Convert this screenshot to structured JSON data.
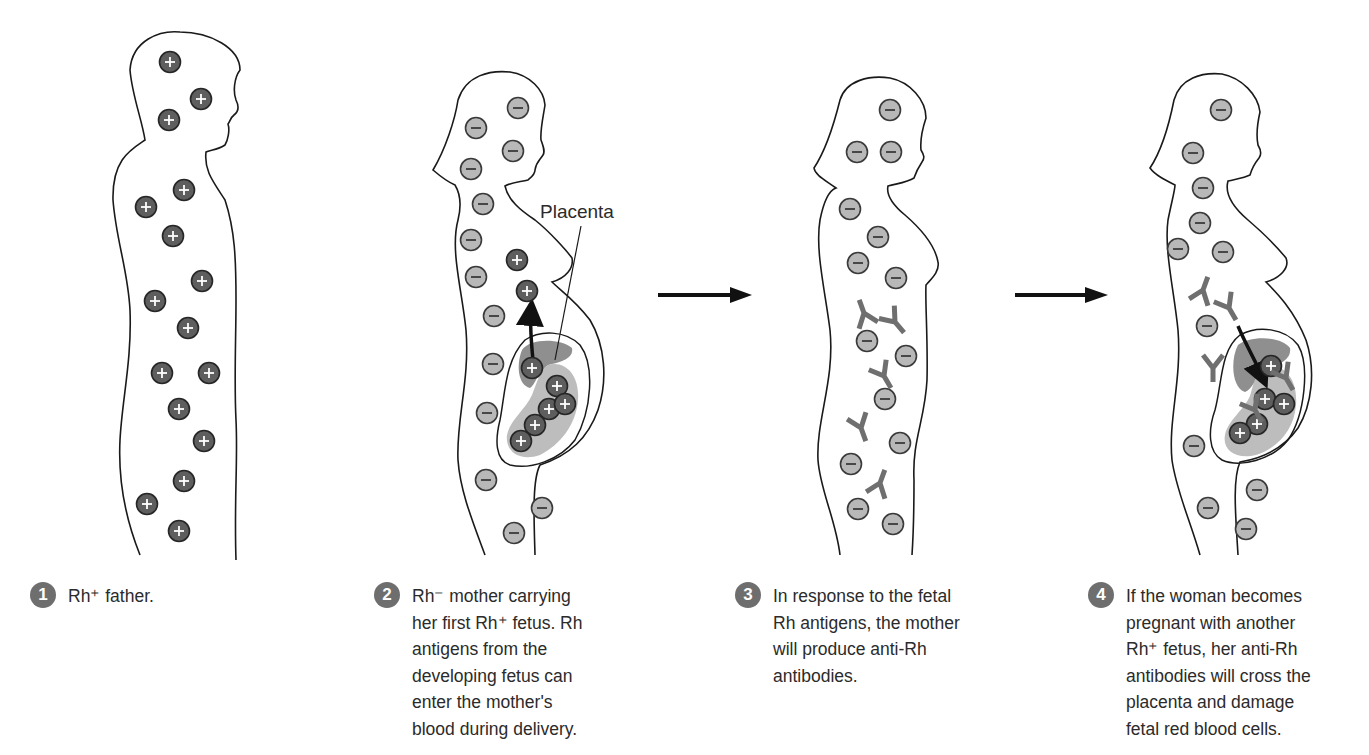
{
  "colors": {
    "rh_positive_cell": "#5e5e5e",
    "rh_negative_cell": "#b8b8b8",
    "antibody": "#7a7a7a",
    "placenta": "#8f8f8f",
    "fetus": "#bdbdbd",
    "outline": "#1a1a1a",
    "badge": "#6e6e6e"
  },
  "labels": {
    "placenta": "Placenta"
  },
  "legend": {
    "positive_symbol": "+",
    "negative_symbol": "−"
  },
  "steps": [
    {
      "number": "1",
      "text": "Rh⁺ father."
    },
    {
      "number": "2",
      "text": "Rh⁻ mother carrying\nher first Rh⁺ fetus.  Rh\nantigens from the\ndeveloping fetus can\nenter the mother's\nblood during delivery."
    },
    {
      "number": "3",
      "text": "In response to the fetal\nRh antigens, the mother\nwill produce anti-Rh\nantibodies."
    },
    {
      "number": "4",
      "text": "If the woman becomes\npregnant with another\nRh⁺ fetus, her anti-Rh\nantibodies will cross the\nplacenta and damage\nfetal red blood cells."
    }
  ],
  "figures": {
    "father": {
      "rh_positive_cells": [
        [
          170,
          62
        ],
        [
          201,
          99
        ],
        [
          169,
          120
        ],
        [
          184,
          190
        ],
        [
          146,
          207
        ],
        [
          173,
          236
        ],
        [
          202,
          281
        ],
        [
          155,
          301
        ],
        [
          188,
          328
        ],
        [
          162,
          373
        ],
        [
          209,
          373
        ],
        [
          179,
          409
        ],
        [
          204,
          441
        ],
        [
          184,
          481
        ],
        [
          147,
          504
        ],
        [
          179,
          531
        ]
      ]
    },
    "mother_first": {
      "rh_negative_cells": [
        [
          518,
          108
        ],
        [
          476,
          128
        ],
        [
          513,
          151
        ],
        [
          471,
          169
        ],
        [
          483,
          204
        ],
        [
          471,
          240
        ],
        [
          476,
          277
        ],
        [
          494,
          316
        ],
        [
          493,
          364
        ],
        [
          487,
          413
        ],
        [
          486,
          480
        ],
        [
          542,
          508
        ],
        [
          514,
          533
        ]
      ],
      "rh_positive_cells_maternal": [
        [
          517,
          260
        ],
        [
          527,
          291
        ]
      ],
      "rh_positive_cells_fetal": [
        [
          532,
          368
        ],
        [
          557,
          386
        ],
        [
          549,
          409
        ],
        [
          565,
          404
        ],
        [
          535,
          425
        ],
        [
          521,
          441
        ]
      ]
    },
    "mother_antibodies": {
      "rh_negative_cells": [
        [
          890,
          110
        ],
        [
          857,
          152
        ],
        [
          891,
          152
        ],
        [
          850,
          209
        ],
        [
          878,
          237
        ],
        [
          858,
          263
        ],
        [
          896,
          278
        ],
        [
          867,
          341
        ],
        [
          906,
          356
        ],
        [
          885,
          399
        ],
        [
          900,
          443
        ],
        [
          851,
          464
        ],
        [
          858,
          509
        ],
        [
          893,
          524
        ]
      ],
      "antibodies": [
        [
          864,
          313,
          160
        ],
        [
          895,
          322,
          -40
        ],
        [
          884,
          376,
          -30
        ],
        [
          861,
          428,
          -20
        ],
        [
          880,
          483,
          -160
        ]
      ]
    },
    "mother_second": {
      "rh_negative_cells": [
        [
          1221,
          110
        ],
        [
          1193,
          153
        ],
        [
          1203,
          188
        ],
        [
          1200,
          223
        ],
        [
          1178,
          249
        ],
        [
          1223,
          252
        ],
        [
          1207,
          326
        ],
        [
          1194,
          446
        ],
        [
          1257,
          490
        ],
        [
          1208,
          508
        ],
        [
          1246,
          529
        ]
      ],
      "antibodies_maternal": [
        [
          1203,
          290,
          -160
        ],
        [
          1229,
          308,
          -30
        ],
        [
          1213,
          368,
          0
        ]
      ],
      "rh_positive_cells_fetal": [
        [
          1271,
          366
        ],
        [
          1265,
          399
        ],
        [
          1284,
          404
        ],
        [
          1257,
          424
        ],
        [
          1240,
          433
        ]
      ],
      "antibodies_fetal": [
        [
          1286,
          378,
          -30
        ],
        [
          1255,
          410,
          -30
        ]
      ]
    }
  }
}
